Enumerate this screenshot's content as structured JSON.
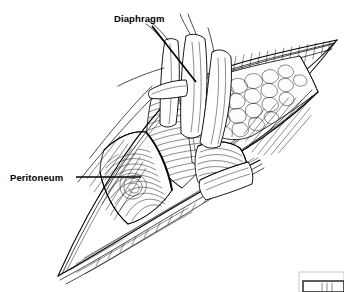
{
  "figure": {
    "background_color": "#ffffff",
    "ink_color": "#000000",
    "width": 344,
    "height": 292,
    "style": "pen-and-ink line drawing",
    "labels": [
      {
        "id": "diaphragm",
        "text": "Diaphragm",
        "x": 114,
        "y": 22,
        "leader_from": [
          152,
          26
        ],
        "leader_to": [
          196,
          82
        ]
      },
      {
        "id": "peritoneum",
        "text": "Peritoneum",
        "x": 10,
        "y": 181,
        "leader_from": [
          76,
          177
        ],
        "leader_to": [
          141,
          177
        ]
      }
    ],
    "scale_marker": {
      "present": true,
      "x": 299,
      "y": 279,
      "width": 45,
      "height": 13,
      "clipped": true
    },
    "regions": [
      {
        "name": "skin-fascia-flap-upper",
        "description": "retracted upper skin and fascia flap with hatched edge"
      },
      {
        "name": "subcutaneous-fat",
        "description": "stippled cobblestone fat lobules"
      },
      {
        "name": "muscle-fibers",
        "description": "parallel hatched muscle bellies"
      },
      {
        "name": "retractor-blades",
        "description": "white blade instruments holding wound open"
      },
      {
        "name": "peritoneal-sac",
        "description": "concentric hatched oval of peritoneum"
      },
      {
        "name": "skin-flap-lower",
        "description": "lower retracted skin margin"
      },
      {
        "name": "wound-apex-left",
        "description": "pointed apex of incision at lower left"
      },
      {
        "name": "wound-apex-right",
        "description": "pointed apex of incision at upper right"
      }
    ]
  }
}
